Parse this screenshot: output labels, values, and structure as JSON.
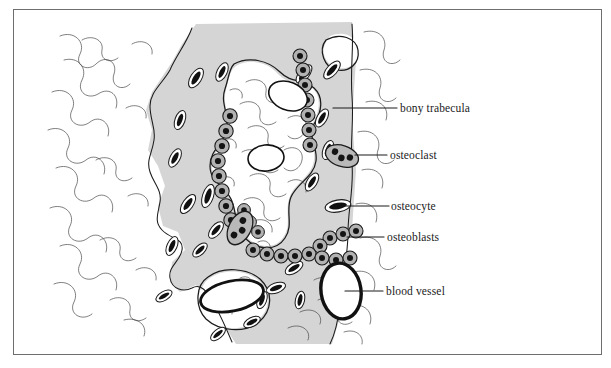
{
  "figure": {
    "border_color": "#6e6e6e",
    "background_color": "#ffffff",
    "bone_matrix_color": "#d5d5d5",
    "ink_color": "#1b1b1b",
    "cell_fill_color": "#9a9a9a"
  },
  "labels": [
    {
      "id": "bony-trabecula",
      "text": "bony trabecula",
      "leader_from": [
        333,
        108
      ],
      "leader_to": [
        397,
        108
      ],
      "points_to": "gray mineralized bone matrix"
    },
    {
      "id": "osteoclast",
      "text": "osteoclast",
      "leader_from": [
        355,
        155
      ],
      "leader_to": [
        387,
        155
      ],
      "points_to": "large multinucleated cell on bone surface"
    },
    {
      "id": "osteocyte",
      "text": "osteocyte",
      "leader_from": [
        345,
        206
      ],
      "leader_to": [
        389,
        206
      ],
      "points_to": "dark lens-shaped cell in lacuna"
    },
    {
      "id": "osteoblasts",
      "text": "osteoblasts",
      "leader_from": [
        347,
        237
      ],
      "leader_to": [
        384,
        237
      ],
      "points_to": "row of cuboidal cells lining trabecula"
    },
    {
      "id": "blood-vessel",
      "text": "blood vessel",
      "leader_from": [
        345,
        291
      ],
      "leader_to": [
        383,
        291
      ],
      "points_to": "large white oval lumen with dark wall"
    }
  ],
  "structures": {
    "bone_matrix_label": "bony trabecula",
    "osteocyte_count_approx": 22,
    "osteoblast_rows": 6,
    "osteoclast_count": 2,
    "blood_vessel_count": 1
  }
}
